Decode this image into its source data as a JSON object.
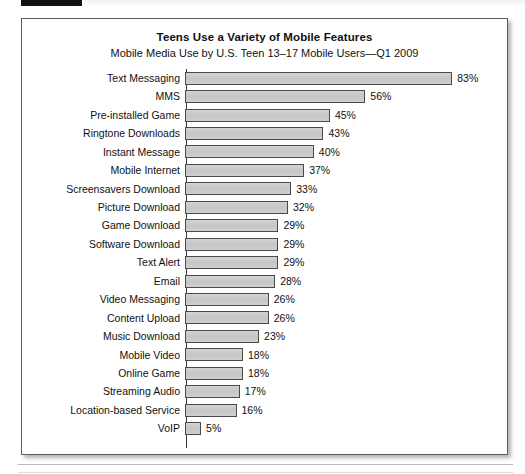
{
  "figure": {
    "title": "Teens Use a Variety of Mobile Features",
    "subtitle": "Mobile Media Use by U.S. Teen 13–17 Mobile Users—Q1 2009"
  },
  "colors": {
    "bar_fill": "#c9c9c9",
    "bar_border": "#4a4a4a",
    "text": "#111111",
    "frame_border": "#5e5e5e",
    "page_background": "#ffffff"
  },
  "chart_data": {
    "type": "bar",
    "orientation": "horizontal",
    "title": "Teens Use a Variety of Mobile Features",
    "subtitle": "Mobile Media Use by U.S. Teen 13–17 Mobile Users—Q1 2009",
    "xlabel": "",
    "ylabel": "",
    "xlim": [
      0,
      83
    ],
    "grid": false,
    "legend": null,
    "value_unit": "%",
    "categories": [
      "Text Messaging",
      "MMS",
      "Pre-installed Game",
      "Ringtone Downloads",
      "Instant Message",
      "Mobile Internet",
      "Screensavers Download",
      "Picture Download",
      "Game Download",
      "Software Download",
      "Text Alert",
      "Email",
      "Video Messaging",
      "Content Upload",
      "Music Download",
      "Mobile Video",
      "Online Game",
      "Streaming Audio",
      "Location-based Service",
      "VoIP"
    ],
    "values": [
      83,
      56,
      45,
      43,
      40,
      37,
      33,
      32,
      29,
      29,
      29,
      28,
      26,
      26,
      23,
      18,
      18,
      17,
      16,
      5
    ],
    "value_labels": [
      "83%",
      "56%",
      "45%",
      "43%",
      "40%",
      "37%",
      "33%",
      "32%",
      "29%",
      "29%",
      "29%",
      "28%",
      "26%",
      "26%",
      "23%",
      "18%",
      "18%",
      "17%",
      "16%",
      "5%"
    ]
  }
}
